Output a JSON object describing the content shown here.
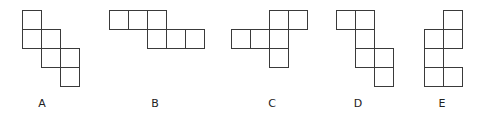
{
  "diagram": {
    "cell_size": 19,
    "stroke_color": "#3a3a3a",
    "options": [
      {
        "label": "A",
        "origin": [
          22,
          10
        ],
        "label_pos": [
          42,
          97
        ],
        "cells": [
          [
            0,
            0
          ],
          [
            0,
            1
          ],
          [
            1,
            1
          ],
          [
            1,
            2
          ],
          [
            2,
            2
          ],
          [
            2,
            3
          ]
        ]
      },
      {
        "label": "B",
        "origin": [
          109,
          10
        ],
        "label_pos": [
          155,
          97
        ],
        "cells": [
          [
            0,
            0
          ],
          [
            1,
            0
          ],
          [
            2,
            0
          ],
          [
            2,
            1
          ],
          [
            3,
            1
          ],
          [
            4,
            1
          ]
        ]
      },
      {
        "label": "C",
        "origin": [
          231,
          10
        ],
        "label_pos": [
          272,
          97
        ],
        "cells": [
          [
            2,
            0
          ],
          [
            3,
            0
          ],
          [
            0,
            1
          ],
          [
            1,
            1
          ],
          [
            2,
            1
          ],
          [
            2,
            2
          ]
        ]
      },
      {
        "label": "D",
        "origin": [
          336,
          10
        ],
        "label_pos": [
          358,
          97
        ],
        "cells": [
          [
            0,
            0
          ],
          [
            1,
            0
          ],
          [
            1,
            1
          ],
          [
            1,
            2
          ],
          [
            2,
            2
          ],
          [
            2,
            3
          ]
        ]
      },
      {
        "label": "E",
        "origin": [
          424,
          10
        ],
        "label_pos": [
          442,
          97
        ],
        "cells": [
          [
            1,
            0
          ],
          [
            0,
            1
          ],
          [
            1,
            1
          ],
          [
            0,
            2
          ],
          [
            0,
            3
          ],
          [
            1,
            3
          ]
        ]
      }
    ]
  }
}
